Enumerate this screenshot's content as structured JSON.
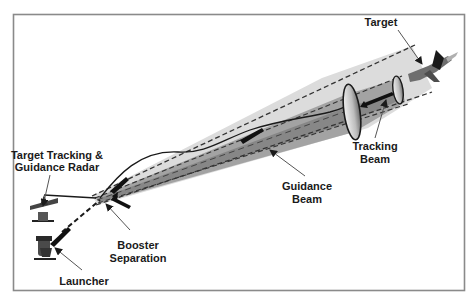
{
  "diagram": {
    "type": "missile-guidance-schematic",
    "labels": {
      "target": "Target",
      "tracking_beam_line1": "Tracking",
      "tracking_beam_line2": "Beam",
      "guidance_beam_line1": "Guidance",
      "guidance_beam_line2": "Beam",
      "radar_line1": "Target Tracking &",
      "radar_line2": "Guidance Radar",
      "booster_line1": "Booster",
      "booster_line2": "Separation",
      "launcher": "Launcher"
    },
    "colors": {
      "frame": "#8a8a8a",
      "outer_beam": "#d9d9d9",
      "inner_beam": "#9a9a9a",
      "core_beam": "#7a7a7a",
      "ink": "#1a1a1a",
      "leader": "#555555"
    },
    "components": [
      "Target aircraft",
      "Tracking beam",
      "Guidance beam",
      "Target tracking & guidance radar",
      "Booster separation",
      "Launcher",
      "Missile"
    ]
  }
}
